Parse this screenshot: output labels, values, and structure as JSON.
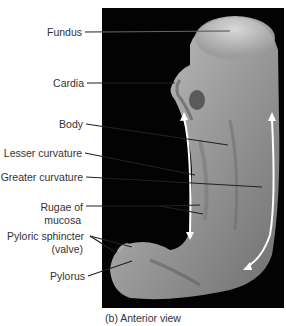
{
  "figure": {
    "caption": "(b)  Anterior view",
    "background_color": "#030303",
    "arrow_color": "#ffffff",
    "leader_color": "#222222"
  },
  "labels": [
    {
      "id": "fundus",
      "text": "Fundus"
    },
    {
      "id": "cardia",
      "text": "Cardia"
    },
    {
      "id": "body",
      "text": "Body"
    },
    {
      "id": "lesser-curvature",
      "text": "Lesser curvature"
    },
    {
      "id": "greater-curvature",
      "text": "Greater curvature"
    },
    {
      "id": "rugae-line1",
      "text": "Rugae of"
    },
    {
      "id": "rugae-line2",
      "text": "mucosa"
    },
    {
      "id": "pyloric-line1",
      "text": "Pyloric sphincter"
    },
    {
      "id": "pyloric-line2",
      "text": "(valve)"
    },
    {
      "id": "pylorus",
      "text": "Pylorus"
    }
  ]
}
